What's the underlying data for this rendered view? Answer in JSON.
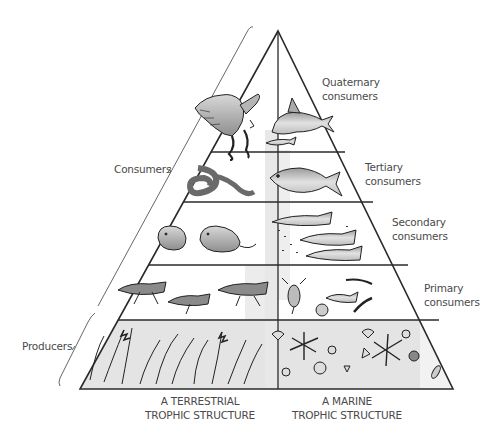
{
  "diagram": {
    "levels": [
      {
        "id": "quaternary",
        "label_line1": "Quaternary",
        "label_line2": "consumers",
        "terrestrial": [
          "eagle",
          "snake"
        ],
        "marine": [
          "shark",
          "fish"
        ]
      },
      {
        "id": "tertiary",
        "label_line1": "Tertiary",
        "label_line2": "consumers",
        "terrestrial": [
          "snake",
          "rodent"
        ],
        "marine": [
          "salmon"
        ]
      },
      {
        "id": "secondary",
        "label_line1": "Secondary",
        "label_line2": "consumers",
        "terrestrial": [
          "rodents"
        ],
        "marine": [
          "small fish"
        ]
      },
      {
        "id": "primary",
        "label_line1": "Primary",
        "label_line2": "consumers",
        "terrestrial": [
          "grasshoppers"
        ],
        "marine": [
          "zooplankton",
          "shrimp",
          "larvae"
        ]
      },
      {
        "id": "producers",
        "terrestrial": [
          "grasses",
          "grain"
        ],
        "marine": [
          "phytoplankton",
          "diatoms"
        ]
      }
    ],
    "brackets": {
      "consumers": "Consumers",
      "producers": "Producers"
    },
    "columns": {
      "terrestrial": {
        "line1": "A TERRESTRIAL",
        "line2": "TROPHIC STRUCTURE"
      },
      "marine": {
        "line1": "A MARINE",
        "line2": "TROPHIC STRUCTURE"
      }
    },
    "colors": {
      "line": "#2a2a2a",
      "producer_fill": "#e6e6e6",
      "center_band": "#ececec",
      "text": "#4a4a4a"
    }
  }
}
